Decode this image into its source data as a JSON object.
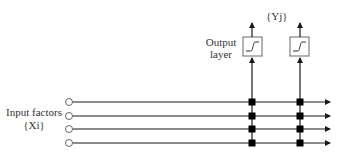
{
  "diagram": {
    "type": "single-layer neural network",
    "output_set_label": "{Yj}",
    "output_layer_label_line1": "Output",
    "output_layer_label_line2": "layer",
    "input_label_line1": "Input factors",
    "input_label_line2": "{Xi}",
    "inputs": [
      {
        "id": "x1"
      },
      {
        "id": "x2"
      },
      {
        "id": "x3"
      },
      {
        "id": "x4"
      }
    ],
    "outputs": [
      {
        "id": "y1",
        "activation": "sigmoid"
      },
      {
        "id": "y2",
        "activation": "sigmoid"
      }
    ],
    "colors": {
      "line": "#1a1a1a",
      "node": "#000000",
      "box_border": "#555555",
      "text": "#333333"
    }
  }
}
